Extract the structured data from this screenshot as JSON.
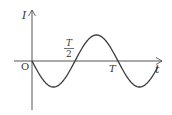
{
  "diagram": {
    "type": "waveform",
    "axes": {
      "y_label": "I",
      "x_label": "t",
      "origin_label": "O"
    },
    "ticks": {
      "half_period_numerator": "T",
      "half_period_denominator": "2",
      "period_label": "T"
    },
    "curve": {
      "function": "I = -I0 sin(2πt/T)",
      "start_direction": "negative",
      "periods_shown": 1.35
    },
    "colors": {
      "axis": "#555555",
      "curve": "#3a3a3a",
      "text": "#333333",
      "background": "#ffffff"
    }
  }
}
